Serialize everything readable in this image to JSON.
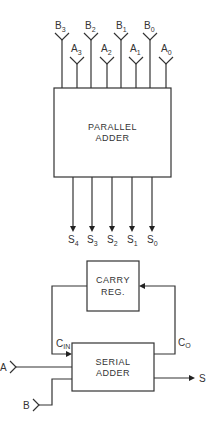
{
  "parallel_adder": {
    "label_line1": "PARALLEL",
    "label_line2": "ADDER",
    "inputs": [
      {
        "name": "B",
        "sub": "3"
      },
      {
        "name": "A",
        "sub": "3"
      },
      {
        "name": "B",
        "sub": "2"
      },
      {
        "name": "A",
        "sub": "2"
      },
      {
        "name": "B",
        "sub": "1"
      },
      {
        "name": "A",
        "sub": "1"
      },
      {
        "name": "B",
        "sub": "0"
      },
      {
        "name": "A",
        "sub": "0"
      }
    ],
    "outputs": [
      {
        "name": "S",
        "sub": "4"
      },
      {
        "name": "S",
        "sub": "3"
      },
      {
        "name": "S",
        "sub": "2"
      },
      {
        "name": "S",
        "sub": "1"
      },
      {
        "name": "S",
        "sub": "0"
      }
    ]
  },
  "serial_adder": {
    "carry_reg_line1": "CARRY",
    "carry_reg_line2": "REG.",
    "label_line1": "SERIAL",
    "label_line2": "ADDER",
    "input_a": "A",
    "input_b": "B",
    "output_s": "S",
    "cin": {
      "name": "C",
      "sub": "IN"
    },
    "co": {
      "name": "C",
      "sub": "O"
    }
  }
}
